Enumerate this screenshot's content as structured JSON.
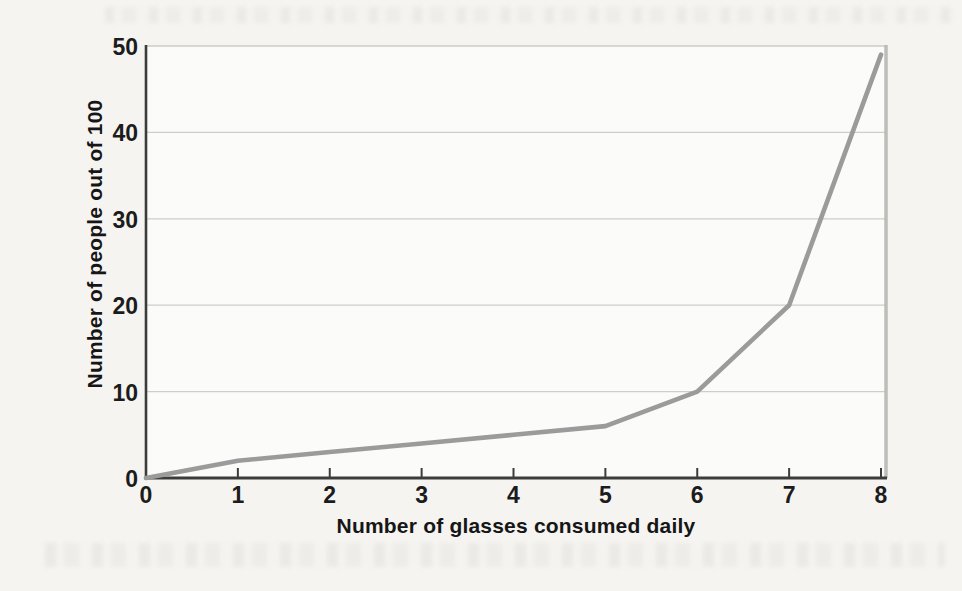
{
  "chart_data": {
    "type": "line",
    "title": "",
    "x": [
      0,
      1,
      2,
      3,
      4,
      5,
      6,
      7,
      8
    ],
    "values": [
      0,
      2,
      3,
      4,
      5,
      6,
      10,
      20,
      49
    ],
    "series_name": "People per 100",
    "xlabel": "Number of glasses consumed daily",
    "ylabel": "Number of people out of 100",
    "xlim": [
      0,
      8
    ],
    "ylim": [
      0,
      50
    ],
    "x_ticks": [
      0,
      1,
      2,
      3,
      4,
      5,
      6,
      7,
      8
    ],
    "y_ticks": [
      0,
      10,
      20,
      30,
      40,
      50
    ],
    "grid": "horizontal-only",
    "legend": "none",
    "colors": {
      "line": "#9b9b9b",
      "axis": "#3c3c3c",
      "gridline": "#cdcdca",
      "plot_frame_right": "#b7b7b4",
      "plot_background": "#fbfbf9",
      "page_background": "#f5f4f1",
      "text": "#1c1c1c"
    }
  }
}
